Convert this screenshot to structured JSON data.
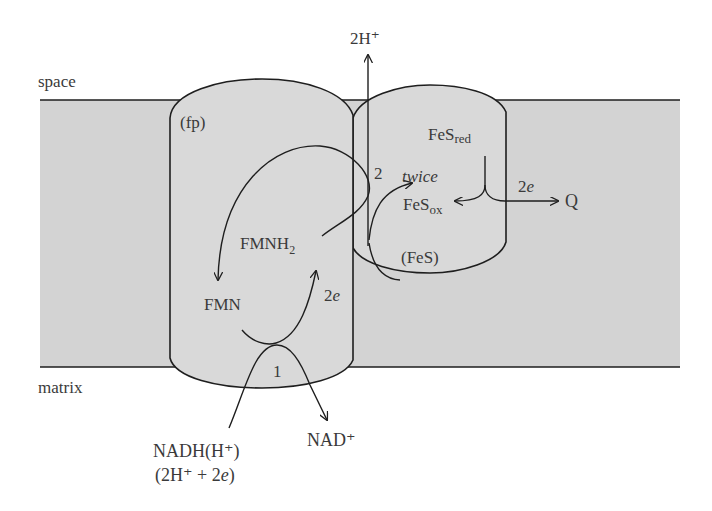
{
  "colors": {
    "background": "#ffffff",
    "membrane_fill": "#d3d3d3",
    "protein_fill": "#d9d9d9",
    "line": "#1e1e1e",
    "text": "#3a3a3a"
  },
  "compartments": {
    "top": "space",
    "bottom": "matrix"
  },
  "proteins": {
    "flavoprotein": "(fp)",
    "iron_sulfur": "(FeS)"
  },
  "species": {
    "fmnh2_base": "FMNH",
    "fmnh2_sub": "2",
    "fmn": "FMN",
    "fes_red_base": "FeS",
    "fes_red_sub": "red",
    "fes_ox_base": "FeS",
    "fes_ox_sub": "ox",
    "q": "Q",
    "nadh_line1": "NADH(H⁺)",
    "nadh_line2_a": "(2H⁺ + 2",
    "nadh_line2_e": "e",
    "nadh_line2_b": ")",
    "nad_plus": "NAD⁺",
    "proton_out": "2H⁺"
  },
  "annotations": {
    "step1": "1",
    "step2": "2",
    "twice": "twice",
    "electrons_fmn_num": "2",
    "electrons_fmn_e": "e",
    "electrons_q_num": "2",
    "electrons_q_e": "e"
  }
}
